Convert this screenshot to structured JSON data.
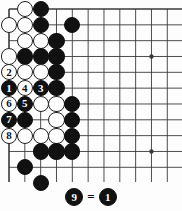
{
  "diagram": {
    "kind": "go-board-problem-diagram",
    "board": {
      "line_color": "#3a3a3a",
      "background_color": "#fdfdfd",
      "edge_line_width_px": 1.6,
      "grid_line_width_px": 0.9,
      "origin_x_px": 9,
      "origin_y_px": 9,
      "spacing_px": 15.83,
      "cols_visible": 11,
      "rows_visible": 11,
      "star_points": [
        {
          "col": 9,
          "row": 3
        },
        {
          "col": 9,
          "row": 9
        }
      ]
    },
    "stone_colors": {
      "black": "#111111",
      "white": "#ffffff",
      "white_outline": "#222222",
      "black_label": "#ffffff",
      "white_label": "#111111"
    },
    "stones": [
      {
        "col": 1,
        "row": 0,
        "color": "white",
        "label": ""
      },
      {
        "col": 2,
        "row": 0,
        "color": "black",
        "label": ""
      },
      {
        "col": 0,
        "row": 1,
        "color": "white",
        "label": ""
      },
      {
        "col": 1,
        "row": 1,
        "color": "white",
        "label": ""
      },
      {
        "col": 2,
        "row": 1,
        "color": "black",
        "label": ""
      },
      {
        "col": 4,
        "row": 1,
        "color": "black",
        "label": ""
      },
      {
        "col": 1,
        "row": 2,
        "color": "white",
        "label": ""
      },
      {
        "col": 2,
        "row": 2,
        "color": "white",
        "label": ""
      },
      {
        "col": 3,
        "row": 2,
        "color": "black",
        "label": ""
      },
      {
        "col": 0,
        "row": 3,
        "color": "white",
        "label": ""
      },
      {
        "col": 1,
        "row": 3,
        "color": "black",
        "label": ""
      },
      {
        "col": 2,
        "row": 3,
        "color": "black",
        "label": ""
      },
      {
        "col": 3,
        "row": 3,
        "color": "black",
        "label": ""
      },
      {
        "col": 0,
        "row": 4,
        "color": "white",
        "label": "2"
      },
      {
        "col": 1,
        "row": 4,
        "color": "white",
        "label": ""
      },
      {
        "col": 2,
        "row": 4,
        "color": "white",
        "label": ""
      },
      {
        "col": 3,
        "row": 4,
        "color": "black",
        "label": ""
      },
      {
        "col": 0,
        "row": 5,
        "color": "black",
        "label": "1"
      },
      {
        "col": 1,
        "row": 5,
        "color": "white",
        "label": "4"
      },
      {
        "col": 2,
        "row": 5,
        "color": "black",
        "label": "3"
      },
      {
        "col": 3,
        "row": 5,
        "color": "black",
        "label": ""
      },
      {
        "col": 0,
        "row": 6,
        "color": "white",
        "label": "6"
      },
      {
        "col": 1,
        "row": 6,
        "color": "black",
        "label": "5"
      },
      {
        "col": 2,
        "row": 6,
        "color": "white",
        "label": ""
      },
      {
        "col": 3,
        "row": 6,
        "color": "white",
        "label": ""
      },
      {
        "col": 4,
        "row": 6,
        "color": "black",
        "label": ""
      },
      {
        "col": 0,
        "row": 7,
        "color": "black",
        "label": "7"
      },
      {
        "col": 1,
        "row": 7,
        "color": "black",
        "label": ""
      },
      {
        "col": 3,
        "row": 7,
        "color": "white",
        "label": ""
      },
      {
        "col": 4,
        "row": 7,
        "color": "black",
        "label": ""
      },
      {
        "col": 0,
        "row": 8,
        "color": "white",
        "label": "8"
      },
      {
        "col": 1,
        "row": 8,
        "color": "white",
        "label": ""
      },
      {
        "col": 2,
        "row": 8,
        "color": "white",
        "label": ""
      },
      {
        "col": 3,
        "row": 8,
        "color": "white",
        "label": ""
      },
      {
        "col": 4,
        "row": 8,
        "color": "black",
        "label": ""
      },
      {
        "col": 2,
        "row": 9,
        "color": "black",
        "label": ""
      },
      {
        "col": 3,
        "row": 9,
        "color": "black",
        "label": ""
      },
      {
        "col": 4,
        "row": 9,
        "color": "black",
        "label": ""
      },
      {
        "col": 1,
        "row": 10,
        "color": "black",
        "label": ""
      },
      {
        "col": 2,
        "row": 11,
        "color": "black",
        "label": ""
      }
    ],
    "caption": {
      "move_label": "9",
      "equals": "=",
      "target_label": "1",
      "text": "9 = 1"
    }
  }
}
